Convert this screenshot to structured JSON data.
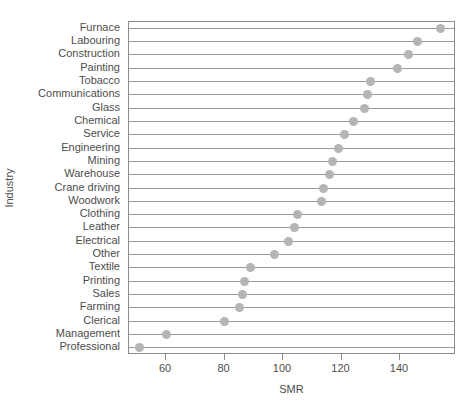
{
  "chart_data": {
    "type": "scatter",
    "title": "",
    "xlabel": "SMR",
    "ylabel": "Industry",
    "xlim": [
      50,
      158
    ],
    "xticks": [
      60,
      80,
      100,
      120,
      140
    ],
    "xtick_labels": [
      "60",
      "80",
      "100",
      "120",
      "140"
    ],
    "grid": "horizontal-row-lines",
    "legend": "none",
    "orientation": "horizontal-dotplot",
    "categories": [
      "Furnace",
      "Labouring",
      "Construction",
      "Painting",
      "Tobacco",
      "Communications",
      "Glass",
      "Chemical",
      "Service",
      "Engineering",
      "Mining",
      "Warehouse",
      "Crane driving",
      "Woodwork",
      "Clothing",
      "Leather",
      "Electrical",
      "Other",
      "Textile",
      "Printing",
      "Sales",
      "Farming",
      "Clerical",
      "Management",
      "Professional"
    ],
    "values": [
      154,
      146,
      143,
      139,
      130,
      129,
      128,
      124,
      121,
      119,
      117,
      116,
      114,
      113,
      105,
      104,
      102,
      97,
      89,
      87,
      86,
      85,
      80,
      60,
      51
    ],
    "point_color": "#b5b5b5",
    "line_color": "#999999",
    "panel_border_color": "#8c8c8c",
    "text_color": "#4d4d4d"
  }
}
